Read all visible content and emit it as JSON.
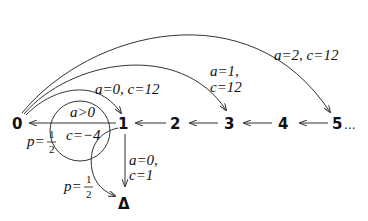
{
  "diagram": {
    "type": "state-transition",
    "nodes": [
      {
        "id": "0",
        "label": "0"
      },
      {
        "id": "1",
        "label": "1"
      },
      {
        "id": "2",
        "label": "2"
      },
      {
        "id": "3",
        "label": "3"
      },
      {
        "id": "4",
        "label": "4"
      },
      {
        "id": "5",
        "label": "5"
      },
      {
        "id": "ellipsis",
        "label": "..."
      },
      {
        "id": "delta",
        "label": "Δ"
      }
    ],
    "edges": [
      {
        "from": "5",
        "to": "4"
      },
      {
        "from": "4",
        "to": "3"
      },
      {
        "from": "3",
        "to": "2"
      },
      {
        "from": "2",
        "to": "1"
      },
      {
        "from": "1",
        "to": "0",
        "label": {
          "action": "a>0",
          "cost": "c=−4"
        }
      },
      {
        "from": "0",
        "to": "1",
        "label": {
          "action": "a=0",
          "cost": "c=12"
        }
      },
      {
        "from": "0",
        "to": "3",
        "label": {
          "action": "a=1,",
          "cost": "c=12"
        }
      },
      {
        "from": "0",
        "to": "5",
        "label": {
          "action": "a=2",
          "cost": "c=12"
        }
      },
      {
        "from": "1",
        "to": "delta",
        "label": {
          "action": "a=0,",
          "cost": "c=1"
        }
      },
      {
        "from": "circle",
        "to": "delta",
        "label": {
          "p": "p=",
          "num": "1",
          "den": "2"
        }
      }
    ],
    "circle_labels": {
      "top": "a>0",
      "bottom": "c=−4"
    },
    "prob_left": {
      "p": "p=",
      "num": "1",
      "den": "2"
    },
    "prob_bottom": {
      "p": "p=",
      "num": "1",
      "den": "2"
    },
    "arc_labels": {
      "a0c12": "a=0, c=12",
      "a1": "a=1,",
      "c12": "c=12",
      "a2c12": "a=2, c=12"
    },
    "down_labels": {
      "a": "a=0,",
      "c": "c=1"
    }
  }
}
